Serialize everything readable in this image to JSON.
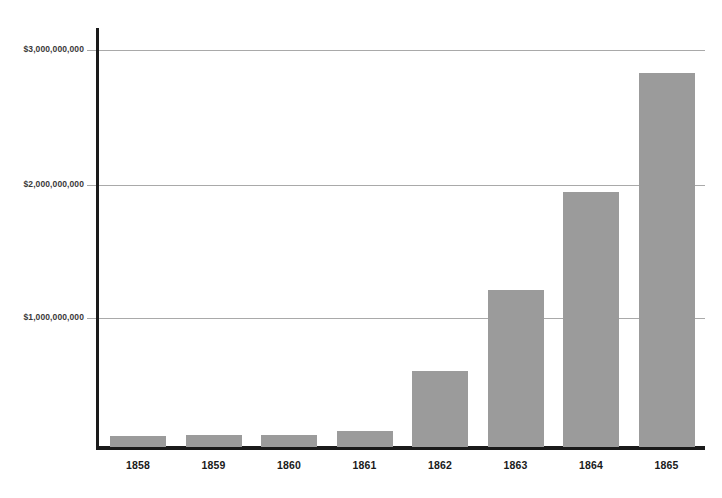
{
  "chart_data": {
    "type": "bar",
    "title": "",
    "xlabel": "",
    "ylabel": "",
    "categories": [
      "1858",
      "1859",
      "1860",
      "1861",
      "1862",
      "1863",
      "1864",
      "1865"
    ],
    "values": [
      80000000,
      90000000,
      90000000,
      120000000,
      570000000,
      1170000000,
      1900000000,
      2790000000
    ],
    "series": [
      {
        "name": "Amount",
        "values": [
          80000000,
          90000000,
          90000000,
          120000000,
          570000000,
          1170000000,
          1900000000,
          2790000000
        ]
      }
    ],
    "ylim": [
      0,
      3150000000
    ],
    "yticks": [
      1000000000,
      2000000000,
      3000000000
    ],
    "ytick_labels": [
      "$1,000,000,000",
      "$2,000,000,000",
      "$3,000,000,000"
    ],
    "grid": true,
    "legend": false,
    "bar_color": "#9b9b9b",
    "gridline_color": "#a9a9a9",
    "axis_color": "#1a1a1a"
  },
  "axes": {
    "y_tick_top": "$3,000,000,000",
    "y_tick_mid": "$2,000,000,000",
    "y_tick_low": "$1,000,000,000"
  },
  "x_categories": [
    {
      "label": "1858"
    },
    {
      "label": "1859"
    },
    {
      "label": "1860"
    },
    {
      "label": "1861"
    },
    {
      "label": "1862"
    },
    {
      "label": "1863"
    },
    {
      "label": "1864"
    },
    {
      "label": "1865"
    }
  ],
  "title_sliver": ""
}
